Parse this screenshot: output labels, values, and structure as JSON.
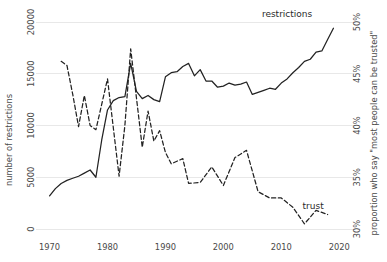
{
  "chart_data": {
    "type": "line",
    "title": "",
    "xlabel": "",
    "ylabel": "number of restrictions",
    "y2label": "proportion who say \"most people can be trusted\"",
    "grid": true,
    "legend_position": "inline-labels",
    "xlim": [
      1968,
      2021
    ],
    "xticks": [
      1970,
      1980,
      1990,
      2000,
      2010,
      2020
    ],
    "xtick_labels": [
      "1970",
      "1980",
      "1990",
      "2000",
      "2010",
      "2020"
    ],
    "ylim": [
      0,
      20000
    ],
    "yticks": [
      0,
      5000,
      10000,
      15000,
      20000
    ],
    "ytick_labels": [
      "0",
      "5000",
      "10000",
      "15000",
      "20000"
    ],
    "y2lim": [
      30,
      50
    ],
    "y2ticks": [
      30,
      35,
      40,
      45,
      50
    ],
    "y2tick_labels": [
      "30%",
      "35%",
      "40%",
      "45%",
      "50%"
    ],
    "series": [
      {
        "name": "restrictions",
        "label": "restrictions",
        "style": "solid",
        "axis": "left",
        "unit": "number of restrictions",
        "x": [
          1970,
          1971,
          1972,
          1973,
          1974,
          1975,
          1976,
          1977,
          1978,
          1979,
          1980,
          1981,
          1982,
          1983,
          1984,
          1985,
          1986,
          1987,
          1988,
          1989,
          1990,
          1991,
          1992,
          1993,
          1994,
          1995,
          1996,
          1997,
          1998,
          1999,
          2000,
          2001,
          2002,
          2003,
          2004,
          2005,
          2006,
          2007,
          2008,
          2009,
          2010,
          2011,
          2012,
          2013,
          2014,
          2015,
          2016,
          2017,
          2018,
          2019
        ],
        "values": [
          3200,
          3900,
          4400,
          4700,
          4900,
          5100,
          5400,
          5700,
          5000,
          8600,
          11500,
          12400,
          12700,
          12800,
          16000,
          13300,
          12600,
          12900,
          12500,
          12300,
          14700,
          15100,
          15200,
          15700,
          16000,
          14800,
          15400,
          14300,
          14300,
          13700,
          13800,
          14100,
          13900,
          14000,
          14200,
          13000,
          13200,
          13400,
          13600,
          13500,
          14100,
          14500,
          15100,
          15600,
          16200,
          16400,
          17100,
          17200,
          18300,
          19400
        ]
      },
      {
        "name": "trust",
        "label": "trust",
        "style": "dashed",
        "axis": "right",
        "unit": "percent",
        "x": [
          1972,
          1973,
          1974,
          1975,
          1976,
          1977,
          1978,
          1980,
          1982,
          1983,
          1984,
          1986,
          1987,
          1988,
          1989,
          1990,
          1991,
          1993,
          1994,
          1996,
          1998,
          2000,
          2002,
          2004,
          2006,
          2008,
          2010,
          2012,
          2014,
          2016,
          2018
        ],
        "values": [
          46.2,
          45.8,
          43.0,
          39.9,
          42.9,
          40.0,
          39.6,
          44.5,
          35.1,
          40.0,
          47.4,
          37.9,
          41.4,
          38.5,
          39.5,
          37.4,
          36.3,
          36.8,
          34.4,
          34.5,
          36.0,
          34.2,
          36.9,
          37.6,
          33.6,
          33.0,
          33.0,
          32.1,
          30.5,
          31.8,
          31.4
        ]
      }
    ],
    "annotations": [
      {
        "text": "restrictions",
        "x": 2011,
        "y_axis": "left",
        "y": 20500
      },
      {
        "text": "trust",
        "x": 2015.5,
        "y_axis": "right",
        "y": 31.9
      }
    ]
  }
}
